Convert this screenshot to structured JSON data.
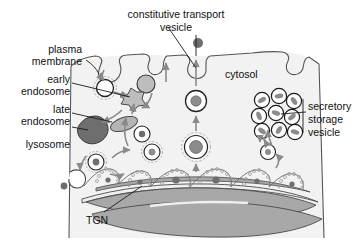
{
  "figure": {
    "background": "#ffffff",
    "width": 355,
    "height": 241
  },
  "colors": {
    "outline": "#333333",
    "cytosol_fill": "#f2f2f2",
    "membrane_line": "#555555",
    "golgi_fill": "#a8a8a8",
    "golgi_light": "#efefef",
    "lysosome_fill": "#6e6e6e",
    "endosome_fill": "#b5b5b5",
    "vesicle_core": "#8c8c8c",
    "coat_stroke": "#9a9a9a",
    "arrow_gray": "#8a8a8a",
    "text": "#111111"
  },
  "labels": {
    "plasma_membrane": {
      "line1": "plasma",
      "line2": "membrane"
    },
    "early_endosome": {
      "line1": "early",
      "line2": "endosome"
    },
    "late_endosome": {
      "line1": "late",
      "line2": "endosome"
    },
    "lysosome": {
      "line1": "lysosome"
    },
    "constitutive_transport_vesicle": {
      "line1": "constitutive transport",
      "line2": "vesicle"
    },
    "cytosol": {
      "line1": "cytosol"
    },
    "secretory_storage_vesicle": {
      "line1": "secretory",
      "line2": "storage",
      "line3": "vesicle"
    },
    "tgn": {
      "line1": "TGN"
    }
  },
  "structures": {
    "golgi_cisternae_count": 3,
    "secretory_vesicle_cluster_count": 9,
    "coated_vesicles_count": 5,
    "extracellular_particles": 2
  }
}
